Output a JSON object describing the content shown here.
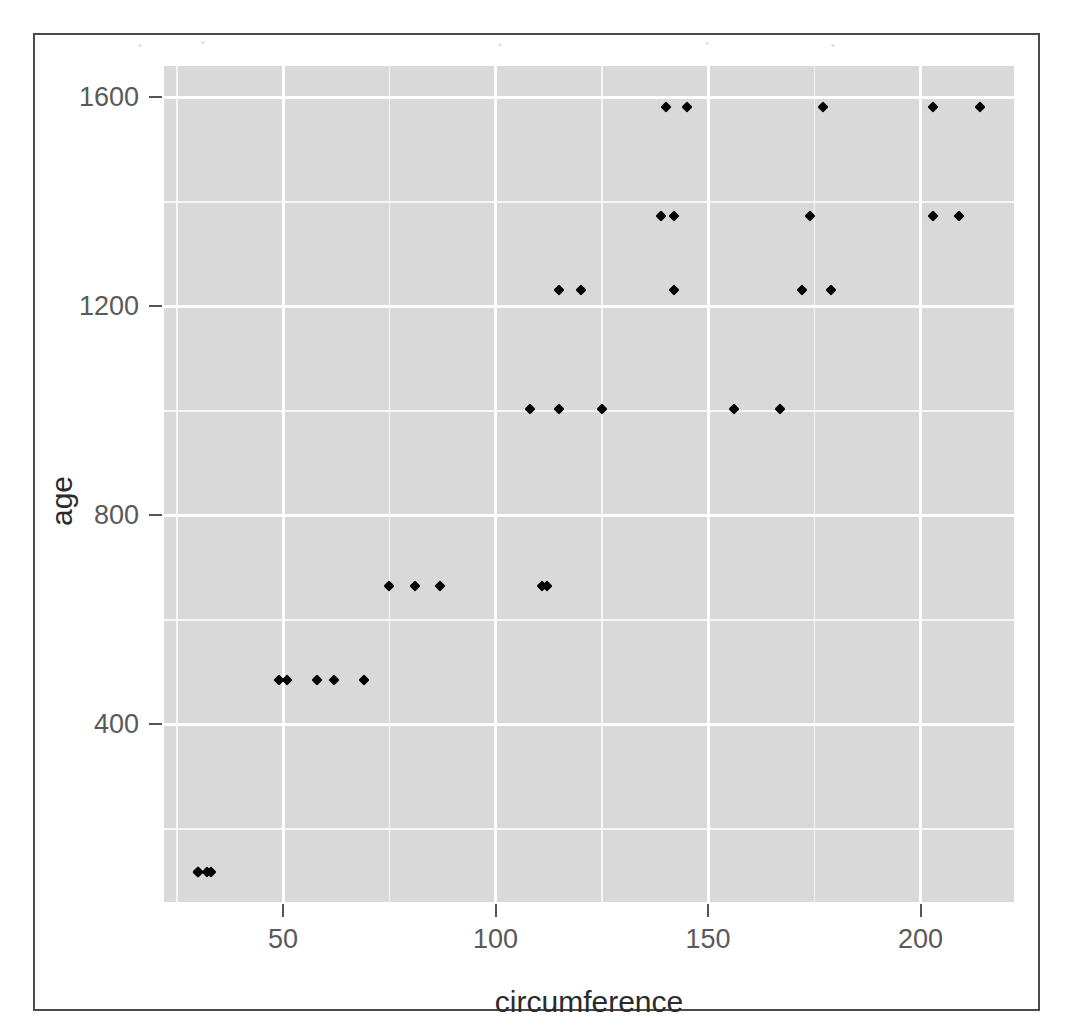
{
  "chart_data": {
    "type": "scatter",
    "title": "",
    "xlabel": "circumference",
    "ylabel": "age",
    "xlim": [
      22,
      222
    ],
    "ylim": [
      60,
      1660
    ],
    "grid": true,
    "legend": "none",
    "x_ticks": [
      50,
      100,
      150,
      200
    ],
    "y_ticks": [
      400,
      800,
      1200,
      1600
    ],
    "x_minor_ticks": [
      25,
      75,
      125,
      175
    ],
    "y_minor_ticks": [
      200,
      600,
      1000,
      1400
    ],
    "point_shape": "diamond",
    "point_color": "#000000",
    "panel_background": "#d9d9d9",
    "gridline_color": "#ffffff",
    "n_points": 35,
    "points": [
      {
        "circumference": 30,
        "age": 118
      },
      {
        "circumference": 33,
        "age": 118
      },
      {
        "circumference": 30,
        "age": 118
      },
      {
        "circumference": 32,
        "age": 118
      },
      {
        "circumference": 30,
        "age": 118
      },
      {
        "circumference": 58,
        "age": 484
      },
      {
        "circumference": 69,
        "age": 484
      },
      {
        "circumference": 51,
        "age": 484
      },
      {
        "circumference": 49,
        "age": 484
      },
      {
        "circumference": 62,
        "age": 484
      },
      {
        "circumference": 87,
        "age": 664
      },
      {
        "circumference": 111,
        "age": 664
      },
      {
        "circumference": 75,
        "age": 664
      },
      {
        "circumference": 81,
        "age": 664
      },
      {
        "circumference": 112,
        "age": 664
      },
      {
        "circumference": 115,
        "age": 1004
      },
      {
        "circumference": 156,
        "age": 1004
      },
      {
        "circumference": 108,
        "age": 1004
      },
      {
        "circumference": 125,
        "age": 1004
      },
      {
        "circumference": 167,
        "age": 1004
      },
      {
        "circumference": 120,
        "age": 1231
      },
      {
        "circumference": 172,
        "age": 1231
      },
      {
        "circumference": 115,
        "age": 1231
      },
      {
        "circumference": 142,
        "age": 1231
      },
      {
        "circumference": 179,
        "age": 1231
      },
      {
        "circumference": 142,
        "age": 1372
      },
      {
        "circumference": 203,
        "age": 1372
      },
      {
        "circumference": 139,
        "age": 1372
      },
      {
        "circumference": 174,
        "age": 1372
      },
      {
        "circumference": 209,
        "age": 1372
      },
      {
        "circumference": 145,
        "age": 1582
      },
      {
        "circumference": 203,
        "age": 1582
      },
      {
        "circumference": 140,
        "age": 1582
      },
      {
        "circumference": 177,
        "age": 1582
      },
      {
        "circumference": 214,
        "age": 1582
      }
    ]
  },
  "axes": {
    "y": {
      "label": "age",
      "tick_labels": [
        "1600",
        "1200",
        "800",
        "400"
      ],
      "tick_values": [
        1600,
        1200,
        800,
        400
      ]
    },
    "x": {
      "label": "circumference",
      "tick_labels": [
        "50",
        "100",
        "150",
        "200"
      ],
      "tick_values": [
        50,
        100,
        150,
        200
      ]
    }
  }
}
